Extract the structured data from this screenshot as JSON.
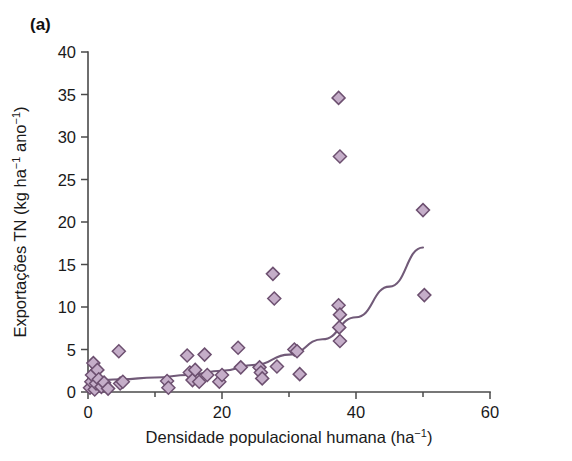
{
  "figure": {
    "panel_label": "(a)",
    "background_color": "#ffffff",
    "width": 572,
    "height": 461
  },
  "style": {
    "marker_fill": "#c5aec9",
    "marker_edge": "#6d5070",
    "curve_color": "#715a78",
    "axis_color": "#4a4a4a",
    "text_color": "#1a1a1a",
    "marker_shape": "diamond",
    "marker_size": 13
  },
  "chart_data": {
    "type": "scatter",
    "title": "(a)",
    "xlabel": "Densidade populacional humana (ha",
    "xlabel_sup": "−1",
    "xlabel_tail": ")",
    "xlabel_full": "Densidade populacional humana (ha⁻¹)",
    "ylabel_full": "Exportações TN (kg ha⁻¹ ano⁻¹)",
    "ylabel_parts": [
      {
        "text": "Exportações TN (kg ha",
        "sup": false
      },
      {
        "text": "−1",
        "sup": true
      },
      {
        "text": " ano",
        "sup": false
      },
      {
        "text": "−1",
        "sup": true
      },
      {
        "text": ")",
        "sup": false
      }
    ],
    "xlim": [
      0,
      60
    ],
    "ylim": [
      0,
      40
    ],
    "xticks": [
      0,
      20,
      40,
      60
    ],
    "xtick_labels": [
      "0",
      "20",
      "40",
      "60"
    ],
    "xminorticks": [
      10,
      30,
      50
    ],
    "yticks": [
      0,
      5,
      10,
      15,
      20,
      25,
      30,
      35,
      40
    ],
    "ytick_labels": [
      "0",
      "5",
      "10",
      "15",
      "20",
      "25",
      "30",
      "35",
      "40"
    ],
    "grid": false,
    "legend": null,
    "points": [
      [
        0.3,
        0.5
      ],
      [
        0.5,
        1.2
      ],
      [
        0.6,
        2.0
      ],
      [
        0.8,
        3.4
      ],
      [
        1.0,
        0.3
      ],
      [
        1.2,
        1.0
      ],
      [
        1.4,
        2.6
      ],
      [
        1.6,
        1.5
      ],
      [
        2.0,
        0.6
      ],
      [
        2.4,
        1.1
      ],
      [
        3.0,
        0.4
      ],
      [
        4.6,
        4.8
      ],
      [
        4.8,
        1.0
      ],
      [
        5.2,
        1.2
      ],
      [
        11.8,
        1.3
      ],
      [
        12.0,
        0.5
      ],
      [
        14.8,
        4.3
      ],
      [
        15.2,
        2.3
      ],
      [
        15.6,
        1.4
      ],
      [
        16.0,
        2.6
      ],
      [
        16.6,
        1.2
      ],
      [
        17.4,
        4.4
      ],
      [
        17.8,
        2.0
      ],
      [
        19.6,
        1.2
      ],
      [
        20.0,
        2.0
      ],
      [
        22.4,
        5.2
      ],
      [
        22.8,
        2.9
      ],
      [
        25.6,
        2.9
      ],
      [
        25.8,
        2.3
      ],
      [
        26.0,
        1.6
      ],
      [
        27.6,
        13.9
      ],
      [
        27.8,
        11.0
      ],
      [
        28.2,
        3.0
      ],
      [
        30.8,
        5.0
      ],
      [
        31.2,
        4.8
      ],
      [
        31.6,
        2.1
      ],
      [
        37.4,
        34.6
      ],
      [
        37.6,
        27.7
      ],
      [
        37.4,
        10.2
      ],
      [
        37.6,
        9.1
      ],
      [
        37.5,
        7.6
      ],
      [
        37.6,
        6.0
      ],
      [
        50.0,
        21.4
      ],
      [
        50.2,
        11.4
      ]
    ],
    "fit_curve": {
      "label": "exponential fit",
      "x": [
        0,
        5,
        10,
        15,
        20,
        25,
        30,
        35,
        40,
        45,
        50
      ],
      "y": [
        1.3,
        1.5,
        1.7,
        2.0,
        2.5,
        3.2,
        4.4,
        6.2,
        8.8,
        12.4,
        17.0
      ]
    }
  }
}
